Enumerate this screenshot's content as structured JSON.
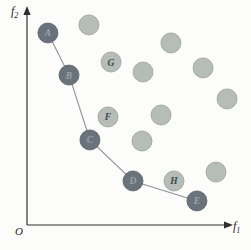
{
  "figure": {
    "origin_label": "O",
    "x_axis_label": {
      "base": "f",
      "sub": "1"
    },
    "y_axis_label": {
      "base": "f",
      "sub": "2"
    }
  },
  "colors": {
    "background": "#fcfcfa",
    "axis": "#2f2f2f",
    "connect_line": "#8f9498",
    "dark_point_fill": "#6a737c",
    "dark_point_edge": "#576069",
    "dark_point_letter": "#9ba3ab",
    "light_point_fill": "#b6bcb7",
    "light_point_edge": "#9aa09b",
    "light_point_letter": "#40464c"
  },
  "chart_data": {
    "type": "scatter",
    "title": "",
    "xlabel": "f1",
    "ylabel": "f2",
    "x_range": [
      0,
      1
    ],
    "y_range": [
      0,
      1
    ],
    "grid": false,
    "legend": false,
    "series": [
      {
        "name": "dark-connected",
        "marker": "dark",
        "connected": true,
        "points": [
          {
            "label": "A",
            "x": 0.102,
            "y": 0.885
          },
          {
            "label": "B",
            "x": 0.205,
            "y": 0.691
          },
          {
            "label": "C",
            "x": 0.307,
            "y": 0.392
          },
          {
            "label": "D",
            "x": 0.517,
            "y": 0.203
          },
          {
            "label": "E",
            "x": 0.829,
            "y": 0.111
          }
        ]
      },
      {
        "name": "light",
        "marker": "light",
        "connected": false,
        "points": [
          {
            "label": "G",
            "x": 0.41,
            "y": 0.751
          },
          {
            "label": "F",
            "x": 0.395,
            "y": 0.498
          },
          {
            "label": "H",
            "x": 0.717,
            "y": 0.203
          },
          {
            "label": "",
            "x": 0.302,
            "y": 0.922
          },
          {
            "label": "",
            "x": 0.702,
            "y": 0.839
          },
          {
            "label": "",
            "x": 0.566,
            "y": 0.705
          },
          {
            "label": "",
            "x": 0.859,
            "y": 0.724
          },
          {
            "label": "",
            "x": 0.976,
            "y": 0.581
          },
          {
            "label": "",
            "x": 0.654,
            "y": 0.507
          },
          {
            "label": "",
            "x": 0.561,
            "y": 0.387
          },
          {
            "label": "",
            "x": 0.922,
            "y": 0.244
          }
        ]
      }
    ]
  }
}
